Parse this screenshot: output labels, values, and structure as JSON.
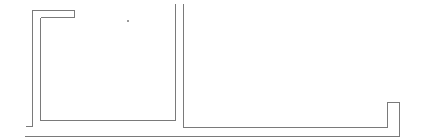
{
  "diagram": {
    "type": "wall-outline",
    "colors": {
      "stroke": "#7a7a7a",
      "background": "#ffffff",
      "marker": "#9a9a9a"
    },
    "segments": [
      {
        "name": "outer-left-wall"
      },
      {
        "name": "inner-left-room-outline"
      },
      {
        "name": "middle-divider-left"
      },
      {
        "name": "right-room-outline"
      },
      {
        "name": "bottom-baseline"
      }
    ],
    "markers": [
      {
        "name": "small-dot"
      }
    ]
  }
}
